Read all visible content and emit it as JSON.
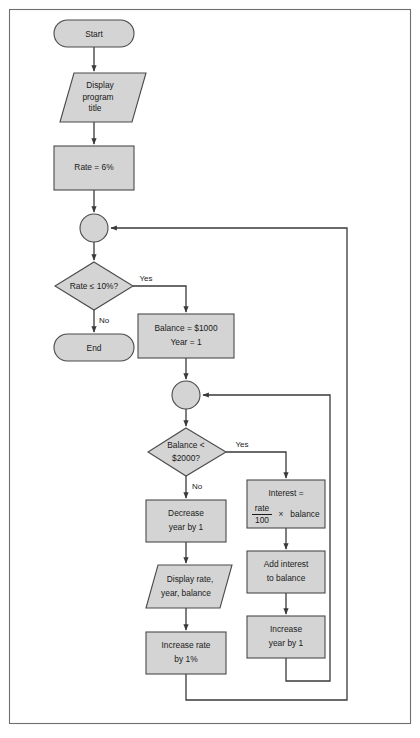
{
  "figure": {
    "caption_fragment": "",
    "background": "#ffffff",
    "shape_fill": "#d4d4d4",
    "shape_stroke": "#4a4a4a",
    "line_color": "#3a3a3a",
    "frame_color": "#6f6f6f"
  },
  "nodes": {
    "start": {
      "label": "Start",
      "type": "terminal"
    },
    "display_title": {
      "line1": "Display",
      "line2": "program",
      "line3": "title",
      "type": "io"
    },
    "set_rate": {
      "label": "Rate = 6%",
      "type": "process"
    },
    "outer_join": {
      "label": "",
      "type": "connector"
    },
    "rate_decision": {
      "line1": "Rate ≤ 10%?",
      "type": "decision"
    },
    "end": {
      "label": "End",
      "type": "terminal"
    },
    "init_balance": {
      "line1": "Balance = $1000",
      "line2": "Year = 1",
      "type": "process"
    },
    "inner_join": {
      "label": "",
      "type": "connector"
    },
    "balance_decision": {
      "line1": "Balance <",
      "line2": "$2000?",
      "type": "decision"
    },
    "decrease_year": {
      "line1": "Decrease",
      "line2": "year by 1",
      "type": "process"
    },
    "display_results": {
      "line1": "Display rate,",
      "line2": "year, balance",
      "type": "io"
    },
    "increase_rate": {
      "line1": "Increase rate",
      "line2": "by 1%",
      "type": "process"
    },
    "interest": {
      "line1": "Interest =",
      "numerator": "rate",
      "denominator": "100",
      "operator": "×",
      "operand": "balance",
      "type": "process"
    },
    "add_interest": {
      "line1": "Add interest",
      "line2": "to balance",
      "type": "process"
    },
    "increase_year": {
      "line1": "Increase",
      "line2": "year by 1",
      "type": "process"
    }
  },
  "edge_labels": {
    "rate_yes": "Yes",
    "rate_no": "No",
    "balance_yes": "Yes",
    "balance_no": "No"
  }
}
